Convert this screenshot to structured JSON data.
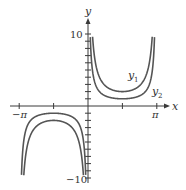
{
  "chart_data": {
    "type": "line",
    "title": "",
    "xlabel": "x",
    "ylabel": "y",
    "xlim": [
      -3.4,
      3.6
    ],
    "ylim": [
      -10,
      10
    ],
    "grid": false,
    "legend_position": "inline labels near curves",
    "x_ticks": [
      {
        "value": -3.14159,
        "label": "−π"
      },
      {
        "value": -1.5708,
        "label": ""
      },
      {
        "value": 1.5708,
        "label": ""
      },
      {
        "value": 3.14159,
        "label": "π"
      }
    ],
    "y_ticks": [
      {
        "value": 10,
        "label": "10"
      },
      {
        "value": -10,
        "label": "−10"
      }
    ],
    "y_minor_tick_step": 1,
    "series": [
      {
        "name": "y1",
        "label_main": "y",
        "label_sub": "1",
        "formula_inferred": "2 csc x",
        "color": "#555555",
        "local_extrema": [
          {
            "x": 1.5708,
            "y": 2
          },
          {
            "x": -1.5708,
            "y": -2
          }
        ],
        "x": [
          -3.04,
          -2.9,
          -2.7,
          -2.4,
          -2.0,
          -1.5708,
          -1.2,
          -0.8,
          -0.5,
          -0.3,
          -0.2,
          0.2,
          0.3,
          0.5,
          0.8,
          1.2,
          1.5708,
          2.0,
          2.4,
          2.7,
          2.9,
          3.04
        ],
        "values": [
          -19.7,
          -8.4,
          -4.7,
          -3.0,
          -2.2,
          -2.0,
          -2.15,
          -2.79,
          -4.17,
          -6.77,
          -10.07,
          10.07,
          6.77,
          4.17,
          2.79,
          2.15,
          2.0,
          2.2,
          3.0,
          4.7,
          8.4,
          19.7
        ]
      },
      {
        "name": "y2",
        "label_main": "y",
        "label_sub": "2",
        "formula_inferred": "csc x",
        "color": "#555555",
        "local_extrema": [
          {
            "x": 1.5708,
            "y": 1
          },
          {
            "x": -1.5708,
            "y": -1
          }
        ],
        "x": [
          -3.04,
          -2.9,
          -2.7,
          -2.4,
          -2.0,
          -1.5708,
          -1.2,
          -0.8,
          -0.5,
          -0.3,
          -0.2,
          0.2,
          0.3,
          0.5,
          0.8,
          1.2,
          1.5708,
          2.0,
          2.4,
          2.7,
          2.9,
          3.04
        ],
        "values": [
          -9.85,
          -4.2,
          -2.35,
          -1.48,
          -1.1,
          -1.0,
          -1.07,
          -1.39,
          -2.09,
          -3.38,
          -5.03,
          5.03,
          3.38,
          2.09,
          1.39,
          1.07,
          1.0,
          1.1,
          1.48,
          2.35,
          4.2,
          9.85
        ]
      }
    ]
  },
  "labels": {
    "x_axis": "x",
    "y_axis": "y",
    "y_top_tick": "10",
    "y_bottom_tick": "−10",
    "x_left_tick": "−π",
    "x_right_tick": "π",
    "y1_main": "y",
    "y1_sub": "1",
    "y2_main": "y",
    "y2_sub": "2"
  }
}
